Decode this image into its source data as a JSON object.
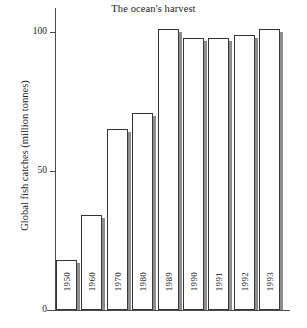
{
  "chart_data": {
    "type": "bar",
    "title": "The ocean's harvest",
    "xlabel": "",
    "ylabel": "Global fish catches (million tonnes)",
    "categories": [
      "1950",
      "1960",
      "1970",
      "1980",
      "1989",
      "1990",
      "1991",
      "1992",
      "1993"
    ],
    "values": [
      18,
      34,
      65,
      71,
      101,
      98,
      98,
      99,
      101
    ],
    "ylim": [
      0,
      110
    ],
    "ytick_labels": [
      "0",
      "50",
      "100"
    ],
    "ytick_values": [
      0,
      50,
      100
    ],
    "grid": false,
    "legend": null,
    "bar_style": "white fill, black outline, grey right-side shadow"
  },
  "axes": {
    "y_ticks": [
      {
        "label": "100",
        "value": 100
      },
      {
        "label": "50",
        "value": 50
      },
      {
        "label": "0",
        "value": 0
      }
    ]
  },
  "colors": {
    "bar_fill": "#ffffff",
    "bar_outline": "#333333",
    "bar_shadow": "#8d8d8d",
    "axis": "#4a4a4a",
    "text": "#222222",
    "background": "#ffffff"
  }
}
